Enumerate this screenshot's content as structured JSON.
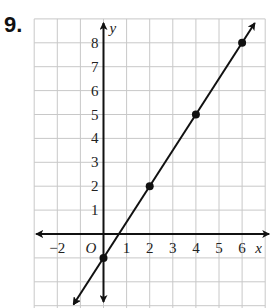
{
  "problem": {
    "number": "9."
  },
  "chart_data": {
    "type": "line",
    "title": "",
    "xlabel": "x",
    "ylabel": "y",
    "origin_label": "O",
    "xlim": [
      -3,
      7
    ],
    "ylim": [
      -3,
      9
    ],
    "grid": true,
    "x_tick_labels": [
      "−2",
      "1",
      "2",
      "3",
      "4",
      "5",
      "6"
    ],
    "x_ticks": [
      -2,
      1,
      2,
      3,
      4,
      5,
      6
    ],
    "y_tick_labels": [
      "1",
      "2",
      "3",
      "4",
      "5",
      "6",
      "7",
      "8"
    ],
    "y_ticks": [
      1,
      2,
      3,
      4,
      5,
      6,
      7,
      8
    ],
    "series": [
      {
        "name": "line",
        "equation": "y = 1.5x - 1",
        "points": [
          {
            "x": 0,
            "y": -1
          },
          {
            "x": 2,
            "y": 2
          },
          {
            "x": 4,
            "y": 5
          },
          {
            "x": 6,
            "y": 8
          }
        ]
      }
    ]
  },
  "colors": {
    "grid": "#c8c8c8",
    "axis": "#111111",
    "line": "#111111"
  }
}
